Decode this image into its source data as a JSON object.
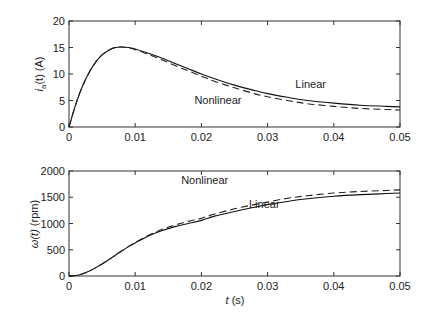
{
  "chart_data": [
    {
      "type": "line",
      "title": "",
      "xlabel": "t (s)",
      "ylabel": "i_a(t) (A)",
      "xlim": [
        0,
        0.05
      ],
      "ylim": [
        0,
        20
      ],
      "xticks": [
        "0",
        "0.01",
        "0.02",
        "0.03",
        "0.04",
        "0.05"
      ],
      "yticks": [
        "0",
        "5",
        "10",
        "15",
        "20"
      ],
      "grid": false,
      "legend": "inline annotations",
      "x": [
        0,
        0.001,
        0.002,
        0.003,
        0.004,
        0.005,
        0.006,
        0.007,
        0.008,
        0.009,
        0.01,
        0.012,
        0.014,
        0.016,
        0.018,
        0.02,
        0.022,
        0.025,
        0.028,
        0.03,
        0.033,
        0.036,
        0.04,
        0.044,
        0.048,
        0.05
      ],
      "series": [
        {
          "name": "Linear",
          "style": "solid",
          "values": [
            0,
            4.2,
            7.6,
            10.2,
            12.2,
            13.6,
            14.5,
            15.0,
            15.1,
            15.0,
            14.7,
            13.9,
            13.0,
            12.0,
            11.0,
            10.0,
            9.1,
            7.9,
            6.9,
            6.3,
            5.6,
            5.0,
            4.5,
            4.1,
            3.9,
            3.8
          ]
        },
        {
          "name": "Nonlinear",
          "style": "dashed",
          "values": [
            0,
            4.2,
            7.6,
            10.2,
            12.2,
            13.6,
            14.5,
            15.0,
            15.1,
            14.9,
            14.6,
            13.7,
            12.7,
            11.6,
            10.6,
            9.6,
            8.6,
            7.4,
            6.3,
            5.7,
            5.0,
            4.4,
            3.9,
            3.5,
            3.3,
            3.2
          ]
        }
      ],
      "annotations": [
        {
          "text": "Linear",
          "x": 0.0365,
          "y": 7.3
        },
        {
          "text": "Nonlinear",
          "x": 0.0225,
          "y": 4.3
        }
      ]
    },
    {
      "type": "line",
      "title": "",
      "xlabel": "t (s)",
      "ylabel": "ω(t) (rpm)",
      "xlim": [
        0,
        0.05
      ],
      "ylim": [
        0,
        2000
      ],
      "xticks": [
        "0",
        "0.01",
        "0.02",
        "0.03",
        "0.04",
        "0.05"
      ],
      "yticks": [
        "0",
        "500",
        "1000",
        "1500",
        "2000"
      ],
      "grid": false,
      "legend": "inline annotations",
      "x": [
        0,
        0.001,
        0.002,
        0.003,
        0.004,
        0.005,
        0.006,
        0.007,
        0.008,
        0.009,
        0.01,
        0.012,
        0.014,
        0.016,
        0.018,
        0.02,
        0.022,
        0.025,
        0.028,
        0.03,
        0.033,
        0.036,
        0.04,
        0.044,
        0.048,
        0.05
      ],
      "series": [
        {
          "name": "Linear",
          "style": "solid",
          "values": [
            0,
            10,
            40,
            90,
            155,
            230,
            310,
            395,
            480,
            560,
            630,
            760,
            860,
            940,
            1000,
            1060,
            1140,
            1230,
            1310,
            1360,
            1420,
            1470,
            1520,
            1550,
            1570,
            1580
          ]
        },
        {
          "name": "Nonlinear",
          "style": "dashed",
          "values": [
            0,
            10,
            40,
            90,
            155,
            230,
            310,
            395,
            480,
            565,
            640,
            775,
            885,
            970,
            1040,
            1100,
            1180,
            1280,
            1360,
            1410,
            1480,
            1530,
            1580,
            1610,
            1630,
            1640
          ]
        }
      ],
      "annotations": [
        {
          "text": "Nonlinear",
          "x": 0.0205,
          "y": 1760
        },
        {
          "text": "Linear",
          "x": 0.0295,
          "y": 1300
        }
      ]
    }
  ],
  "labels": {
    "top_ylabel_main": "i",
    "top_ylabel_sub": "a",
    "top_ylabel_rest": "(t) (A)",
    "bottom_ylabel_main": "ω(t)",
    "bottom_ylabel_rest": " (rpm)",
    "xlabel_italic": "t",
    "xlabel_rest": " (s)"
  }
}
